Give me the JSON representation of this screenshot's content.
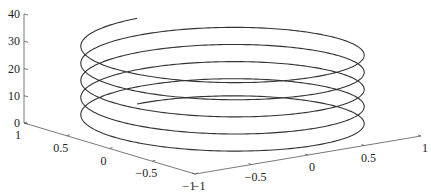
{
  "chart_data": {
    "type": "line",
    "subtype": "3d-helix",
    "title": "",
    "xlabel": "",
    "ylabel": "",
    "zlabel": "",
    "series": [
      {
        "name": "helix",
        "x_expr": "cos(t)",
        "y_expr": "sin(t)",
        "z_expr": "t",
        "t_range": [
          0,
          31.4159
        ],
        "color": "#333333"
      }
    ],
    "xlim": [
      -1,
      1
    ],
    "ylim": [
      -1,
      1
    ],
    "zlim": [
      0,
      40
    ],
    "x_ticks": [
      1,
      0.5,
      0,
      -0.5,
      -1
    ],
    "x_tick_labels": [
      "1",
      "0.5",
      "0",
      "−0.5",
      "−1"
    ],
    "y_ticks": [
      -1,
      -0.5,
      0,
      0.5,
      1
    ],
    "y_tick_labels": [
      "−1",
      "−0.5",
      "0",
      "0.5",
      "1"
    ],
    "z_ticks": [
      0,
      10,
      20,
      30,
      40
    ],
    "z_tick_labels": [
      "0",
      "10",
      "20",
      "30",
      "40"
    ],
    "grid": false,
    "legend": null
  }
}
